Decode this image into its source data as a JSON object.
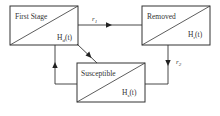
{
  "diagram": {
    "type": "compartment-flow",
    "nodes": [
      {
        "id": "first_stage",
        "title": "First Stage",
        "func_main": "H",
        "func_sub": "d",
        "func_arg": "(t)"
      },
      {
        "id": "removed",
        "title": "Removed",
        "func_main": "H",
        "func_sub": "r",
        "func_arg": "(t)"
      },
      {
        "id": "susceptible",
        "title": "Susceptible",
        "func_main": "H",
        "func_sub": "s",
        "func_arg": "(t)"
      }
    ],
    "edges": [
      {
        "from": "first_stage",
        "to": "removed",
        "label_main": "r",
        "label_sub": "1"
      },
      {
        "from": "removed",
        "to": "susceptible",
        "label_main": "r",
        "label_sub": "2"
      },
      {
        "from": "first_stage",
        "to": "susceptible",
        "label_main": "",
        "label_sub": ""
      },
      {
        "from": "susceptible",
        "to": "first_stage",
        "label_main": "",
        "label_sub": ""
      }
    ]
  }
}
